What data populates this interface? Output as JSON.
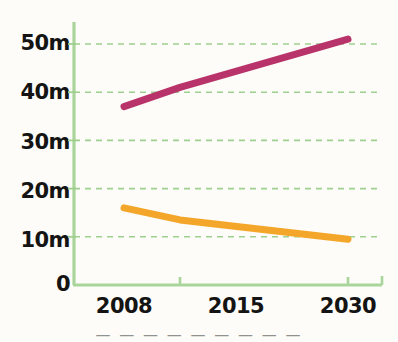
{
  "chart_data": {
    "type": "line",
    "title": "",
    "subtitle": "",
    "xlabel": "",
    "ylabel": "",
    "categories": [
      "2008",
      "2015",
      "2030"
    ],
    "x_tick_labels": [
      "2008",
      "2015",
      "2030"
    ],
    "y_tick_labels": [
      "0",
      "10m",
      "20m",
      "30m",
      "40m",
      "50m"
    ],
    "y_tick_values": [
      0,
      10,
      20,
      30,
      40,
      50
    ],
    "ylim": [
      0,
      54
    ],
    "grid": "horizontal-dashed",
    "legend": "none",
    "series": [
      {
        "name": "series-magenta",
        "color": "#b8336a",
        "values": [
          37,
          41,
          51
        ]
      },
      {
        "name": "series-orange",
        "color": "#f4a62a",
        "values": [
          16,
          13.5,
          9.5
        ]
      }
    ]
  },
  "axis": {
    "line_color": "#a9d59b",
    "grid_color": "#9ecf8e",
    "label_color": "#141414"
  },
  "caption": {
    "cut_off_text": "— — — — — — — — —"
  }
}
